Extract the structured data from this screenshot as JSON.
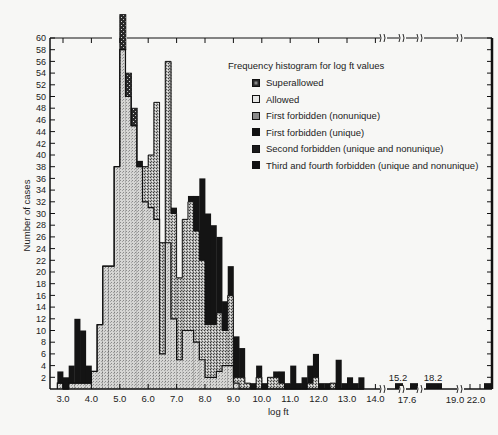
{
  "chart_data": {
    "type": "bar",
    "subtype": "stacked-histogram",
    "title": "Frequency histogram for log ft values",
    "xlabel": "log ft",
    "ylabel": "Number of cases",
    "ylim": [
      0,
      60
    ],
    "yticks": [
      2,
      4,
      6,
      8,
      10,
      12,
      14,
      16,
      18,
      20,
      22,
      24,
      26,
      28,
      30,
      32,
      34,
      36,
      38,
      40,
      42,
      44,
      46,
      48,
      50,
      52,
      54,
      56,
      58,
      60
    ],
    "xticks": [
      "3.0",
      "4.0",
      "5.0",
      "6.0",
      "7.0",
      "8.0",
      "9.0",
      "10.0",
      "11.0",
      "12.0",
      "13.0",
      "14.0"
    ],
    "xbreak_labels_below": [
      "17.6",
      "19.0",
      "22.0"
    ],
    "xbreak_labels_above": [
      "15.2",
      "18.2"
    ],
    "bin_width": 0.2,
    "grid": false,
    "legend_position": "upper right",
    "legend": [
      {
        "name": "Superallowed",
        "pattern": "speckled-dark"
      },
      {
        "name": "Allowed",
        "pattern": "light-dots"
      },
      {
        "name": "First forbidden (nonunique)",
        "pattern": "medium-dots"
      },
      {
        "name": "First forbidden (unique)",
        "pattern": "black"
      },
      {
        "name": "Second forbidden (unique and nonunique)",
        "pattern": "black"
      },
      {
        "name": "Third and fourth forbidden (unique and nonunique)",
        "pattern": "black"
      }
    ],
    "series_note": "Cumulative stacked heights read approximately from the figure",
    "bins": [
      {
        "x": 2.8,
        "allowed": 1,
        "ff_nonunique": 0,
        "forbidden": 3
      },
      {
        "x": 3.0,
        "allowed": 0,
        "ff_nonunique": 0,
        "forbidden": 2
      },
      {
        "x": 3.2,
        "allowed": 1,
        "ff_nonunique": 0,
        "forbidden": 4
      },
      {
        "x": 3.4,
        "allowed": 1,
        "ff_nonunique": 0,
        "forbidden": 12
      },
      {
        "x": 3.6,
        "allowed": 1,
        "ff_nonunique": 0,
        "forbidden": 10
      },
      {
        "x": 3.8,
        "allowed": 1,
        "ff_nonunique": 0,
        "forbidden": 4
      },
      {
        "x": 4.0,
        "allowed": 3,
        "ff_nonunique": 0,
        "forbidden": 3
      },
      {
        "x": 4.2,
        "allowed": 11,
        "ff_nonunique": 0,
        "forbidden": 11
      },
      {
        "x": 4.4,
        "allowed": 21,
        "ff_nonunique": 0,
        "forbidden": 21
      },
      {
        "x": 4.6,
        "allowed": 21,
        "ff_nonunique": 0,
        "forbidden": 21
      },
      {
        "x": 4.8,
        "allowed": 38,
        "ff_nonunique": 0,
        "forbidden": 38
      },
      {
        "x": 5.0,
        "allowed": 58,
        "ff_nonunique": 58,
        "forbidden": 58,
        "superallowed": 64
      },
      {
        "x": 5.2,
        "allowed": 50,
        "ff_nonunique": 50,
        "forbidden": 50,
        "superallowed": 54
      },
      {
        "x": 5.4,
        "allowed": 45,
        "ff_nonunique": 45,
        "forbidden": 45,
        "superallowed": 48
      },
      {
        "x": 5.6,
        "allowed": 38,
        "ff_nonunique": 38,
        "forbidden": 39
      },
      {
        "x": 5.8,
        "allowed": 32,
        "ff_nonunique": 38,
        "forbidden": 38
      },
      {
        "x": 6.0,
        "allowed": 31,
        "ff_nonunique": 40,
        "forbidden": 40
      },
      {
        "x": 6.2,
        "allowed": 29,
        "ff_nonunique": 49,
        "forbidden": 49
      },
      {
        "x": 6.4,
        "allowed": 6,
        "ff_nonunique": 25,
        "forbidden": 25
      },
      {
        "x": 6.6,
        "allowed": 25,
        "ff_nonunique": 56,
        "forbidden": 56
      },
      {
        "x": 6.8,
        "allowed": 12,
        "ff_nonunique": 30,
        "forbidden": 31
      },
      {
        "x": 7.0,
        "allowed": 5,
        "ff_nonunique": 19,
        "forbidden": 19
      },
      {
        "x": 7.2,
        "allowed": 10,
        "ff_nonunique": 29,
        "forbidden": 29
      },
      {
        "x": 7.4,
        "allowed": 10,
        "ff_nonunique": 32,
        "forbidden": 33
      },
      {
        "x": 7.6,
        "allowed": 8,
        "ff_nonunique": 27,
        "forbidden": 33
      },
      {
        "x": 7.8,
        "allowed": 5,
        "ff_nonunique": 22,
        "forbidden": 36
      },
      {
        "x": 8.0,
        "allowed": 2,
        "ff_nonunique": 11,
        "forbidden": 30
      },
      {
        "x": 8.2,
        "allowed": 2,
        "ff_nonunique": 11,
        "forbidden": 28
      },
      {
        "x": 8.4,
        "allowed": 3,
        "ff_nonunique": 13,
        "forbidden": 26
      },
      {
        "x": 8.6,
        "allowed": 4,
        "ff_nonunique": 10,
        "forbidden": 15
      },
      {
        "x": 8.8,
        "allowed": 4,
        "ff_nonunique": 16,
        "forbidden": 21
      },
      {
        "x": 9.0,
        "allowed": 1,
        "ff_nonunique": 2,
        "forbidden": 9
      },
      {
        "x": 9.2,
        "allowed": 0,
        "ff_nonunique": 2,
        "forbidden": 7
      },
      {
        "x": 9.4,
        "allowed": 0,
        "ff_nonunique": 1,
        "forbidden": 1
      },
      {
        "x": 9.6,
        "allowed": 0,
        "ff_nonunique": 0,
        "forbidden": 1
      },
      {
        "x": 9.8,
        "allowed": 0,
        "ff_nonunique": 2,
        "forbidden": 4
      },
      {
        "x": 10.0,
        "allowed": 0,
        "ff_nonunique": 0,
        "forbidden": 1
      },
      {
        "x": 10.2,
        "allowed": 0,
        "ff_nonunique": 2,
        "forbidden": 2
      },
      {
        "x": 10.4,
        "allowed": 0,
        "ff_nonunique": 2,
        "forbidden": 3
      },
      {
        "x": 10.6,
        "allowed": 0,
        "ff_nonunique": 1,
        "forbidden": 3
      },
      {
        "x": 10.8,
        "allowed": 0,
        "ff_nonunique": 0,
        "forbidden": 1
      },
      {
        "x": 11.0,
        "allowed": 0,
        "ff_nonunique": 0,
        "forbidden": 4
      },
      {
        "x": 11.2,
        "allowed": 0,
        "ff_nonunique": 0,
        "forbidden": 1
      },
      {
        "x": 11.4,
        "allowed": 0,
        "ff_nonunique": 0,
        "forbidden": 2
      },
      {
        "x": 11.6,
        "allowed": 0,
        "ff_nonunique": 1,
        "forbidden": 4
      },
      {
        "x": 11.8,
        "allowed": 0,
        "ff_nonunique": 2,
        "forbidden": 6
      },
      {
        "x": 12.0,
        "allowed": 0,
        "ff_nonunique": 0,
        "forbidden": 1
      },
      {
        "x": 12.2,
        "allowed": 0,
        "ff_nonunique": 0,
        "forbidden": 1
      },
      {
        "x": 12.4,
        "allowed": 0,
        "ff_nonunique": 1,
        "forbidden": 1
      },
      {
        "x": 12.6,
        "allowed": 0,
        "ff_nonunique": 0,
        "forbidden": 5
      },
      {
        "x": 12.8,
        "allowed": 0,
        "ff_nonunique": 0,
        "forbidden": 1
      },
      {
        "x": 13.0,
        "allowed": 0,
        "ff_nonunique": 0,
        "forbidden": 2
      },
      {
        "x": 13.2,
        "allowed": 0,
        "ff_nonunique": 0,
        "forbidden": 1
      },
      {
        "x": 13.4,
        "allowed": 0,
        "ff_nonunique": 0,
        "forbidden": 2
      }
    ],
    "broken_axis_bins": [
      {
        "label": "15.2",
        "px": 395,
        "w": 8,
        "value": 1
      },
      {
        "label": "17.6",
        "px": 410,
        "w": 8,
        "value": 1
      },
      {
        "label": "18.2",
        "px": 426,
        "w": 16,
        "value": 1
      },
      {
        "label": "22.0",
        "px": 484,
        "w": 7,
        "value": 1
      }
    ]
  },
  "colors": {
    "background": "#f7f7f5",
    "axis": "#111111",
    "allowed_fill": "#c9c9c9",
    "ff_nonunique_fill": "#9a9a9a",
    "forbidden_fill": "#151515",
    "superallowed_fill": "#3a3a3a"
  }
}
